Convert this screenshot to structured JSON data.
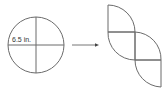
{
  "diagram": {
    "circle": {
      "label": "6.5 in.",
      "divisions": 4
    },
    "arrow": {
      "direction": "right"
    },
    "result": {
      "pieces": 4,
      "description": "quarter-circle sectors rearranged in staircase"
    },
    "colors": {
      "stroke": "#6b6b6b",
      "arrow": "#555555",
      "background": "#ffffff"
    }
  }
}
